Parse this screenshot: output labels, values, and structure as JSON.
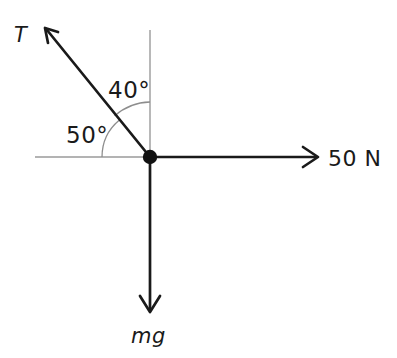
{
  "diagram": {
    "background_color": "#ffffff",
    "vector_color": "#1a1a1a",
    "axis_color": "#9a9a9a",
    "arc_color": "#8d8d8d",
    "origin": {
      "x": 150,
      "y": 157,
      "dot_radius": 7
    },
    "axes": {
      "horizontal": {
        "x1": 35,
        "y1": 157,
        "x2": 318,
        "y2": 157
      },
      "vertical": {
        "x1": 150,
        "y1": 30,
        "x2": 150,
        "y2": 312
      }
    },
    "vectors": [
      {
        "name": "tension",
        "label": "T",
        "style": "italic",
        "direction_deg_from_positive_x": 130,
        "from": {
          "x": 150,
          "y": 157
        },
        "to": {
          "x": 45,
          "y": 28
        },
        "label_position": {
          "x": 14,
          "y": 42
        }
      },
      {
        "name": "applied-force",
        "label": "50 N",
        "style": "normal",
        "direction_deg_from_positive_x": 0,
        "from": {
          "x": 150,
          "y": 157
        },
        "to": {
          "x": 318,
          "y": 157
        },
        "label_position": {
          "x": 328,
          "y": 166
        }
      },
      {
        "name": "weight",
        "label": "mg",
        "style": "italic",
        "direction_deg_from_positive_x": 270,
        "from": {
          "x": 150,
          "y": 157
        },
        "to": {
          "x": 150,
          "y": 312
        },
        "label_position": {
          "x": 131,
          "y": 343
        }
      }
    ],
    "angles": [
      {
        "name": "angle-from-vertical",
        "value": "40",
        "degree_symbol": "°",
        "label": "40°",
        "between": [
          "vertical-axis-up",
          "tension-vector"
        ],
        "arc_radius": 55,
        "start_deg_from_positive_x": 90,
        "end_deg_from_positive_x": 130,
        "label_position": {
          "x": 108,
          "y": 98
        }
      },
      {
        "name": "angle-from-horizontal",
        "value": "50",
        "degree_symbol": "°",
        "label": "50°",
        "between": [
          "horizontal-axis-left",
          "tension-vector"
        ],
        "arc_radius": 48,
        "start_deg_from_positive_x": 130,
        "end_deg_from_positive_x": 180,
        "label_position": {
          "x": 66,
          "y": 143
        }
      }
    ]
  }
}
